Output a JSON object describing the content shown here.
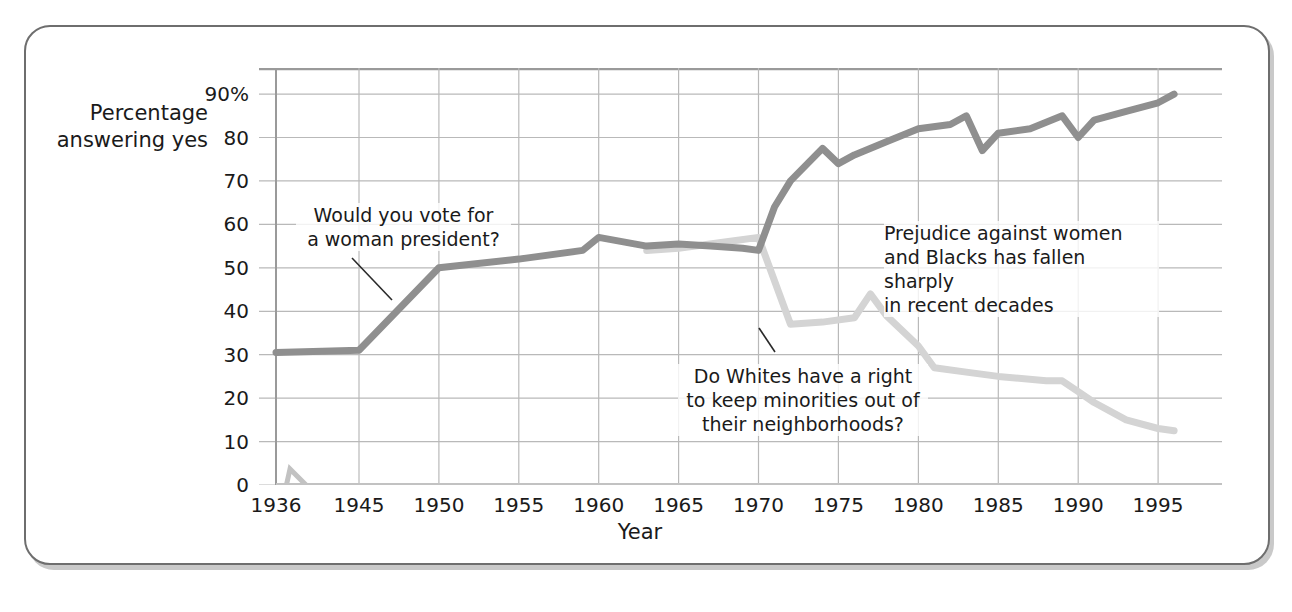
{
  "figure": {
    "y_axis_title": "Percentage\nanswering yes",
    "x_axis_title": "Year"
  },
  "annotations": {
    "women": "Would you vote for\na woman president?",
    "whites": "Do Whites have a right\nto keep minorities out of\ntheir neighborhoods?",
    "summary": "Prejudice against women\nand Blacks has fallen sharply\nin recent decades"
  },
  "colors": {
    "series_women": "#8f8f8f",
    "series_whites": "#d4d4d4",
    "grid": "#b9b9b9",
    "frame": "#6e6e6e",
    "shadow": "#c9c9c9",
    "text": "#1a1a1a"
  },
  "chart_data": {
    "type": "line",
    "title": "",
    "xlabel": "Year",
    "ylabel": "Percentage answering yes",
    "xlim": [
      1936,
      1999
    ],
    "ylim": [
      0,
      96
    ],
    "grid": true,
    "legend": "annotated-inline",
    "axis_break": {
      "between": [
        1936,
        1945
      ],
      "note": "x-axis break symbol between 1936 and 1945"
    },
    "ytick_labels": [
      "90%",
      "80",
      "70",
      "60",
      "50",
      "40",
      "30",
      "20",
      "10",
      "0"
    ],
    "ytick_values": [
      90,
      80,
      70,
      60,
      50,
      40,
      30,
      20,
      10,
      0
    ],
    "xtick_labels": [
      "1936",
      "1945",
      "1950",
      "1955",
      "1960",
      "1965",
      "1970",
      "1975",
      "1980",
      "1985",
      "1990",
      "1995"
    ],
    "xtick_values": [
      1936,
      1945,
      1950,
      1955,
      1960,
      1965,
      1970,
      1975,
      1980,
      1985,
      1990,
      1995
    ],
    "series": [
      {
        "name": "Would you vote for a woman president?",
        "color": "#8f8f8f",
        "x": [
          1936,
          1945,
          1950,
          1955,
          1959,
          1960,
          1963,
          1965,
          1967,
          1969,
          1970,
          1971,
          1972,
          1974,
          1975,
          1976,
          1978,
          1980,
          1982,
          1983,
          1984,
          1985,
          1987,
          1989,
          1990,
          1991,
          1993,
          1995,
          1996
        ],
        "values": [
          30.5,
          31,
          50,
          52,
          54,
          57,
          55,
          55.5,
          55,
          54.5,
          54,
          64,
          70,
          77.5,
          74,
          76,
          79,
          82,
          83,
          85,
          77,
          81,
          82,
          85,
          80,
          84,
          86,
          88,
          90
        ]
      },
      {
        "name": "Do Whites have a right to keep minorities out of their neighborhoods?",
        "color": "#d4d4d4",
        "x": [
          1963,
          1965,
          1968,
          1970,
          1972,
          1974,
          1976,
          1977,
          1978,
          1980,
          1981,
          1983,
          1985,
          1988,
          1989,
          1990,
          1991,
          1993,
          1995,
          1996
        ],
        "values": [
          54,
          54.5,
          56,
          57,
          37,
          37.5,
          38.5,
          44,
          39,
          32,
          27,
          26,
          25,
          24,
          24,
          21.5,
          19,
          15,
          13,
          12.5
        ]
      }
    ]
  }
}
